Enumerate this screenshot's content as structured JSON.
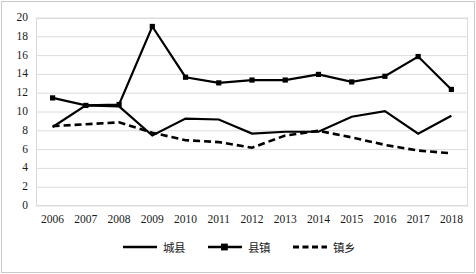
{
  "chart_data": {
    "type": "line",
    "title": "",
    "xlabel": "",
    "ylabel": "",
    "ylim": [
      0,
      20
    ],
    "ytick_step": 2,
    "grid": true,
    "legend_position": "bottom",
    "categories": [
      "2006",
      "2007",
      "2008",
      "2009",
      "2010",
      "2011",
      "2012",
      "2013",
      "2014",
      "2015",
      "2016",
      "2017",
      "2018"
    ],
    "yticks": [
      "0",
      "2",
      "4",
      "6",
      "8",
      "10",
      "12",
      "14",
      "16",
      "18",
      "20"
    ],
    "series": [
      {
        "name": "城县",
        "style": "solid",
        "marker": "none",
        "color": "#000000",
        "values": [
          8.4,
          10.7,
          10.6,
          7.5,
          9.3,
          9.2,
          7.7,
          7.9,
          7.9,
          9.5,
          10.1,
          7.7,
          9.6
        ]
      },
      {
        "name": "县镇",
        "style": "solid",
        "marker": "square",
        "color": "#000000",
        "values": [
          11.5,
          10.7,
          10.8,
          19.1,
          13.7,
          13.1,
          13.4,
          13.4,
          14.0,
          13.2,
          13.8,
          15.9,
          12.4
        ]
      },
      {
        "name": "镇乡",
        "style": "dashed",
        "marker": "none",
        "color": "#000000",
        "values": [
          8.5,
          8.7,
          8.9,
          7.8,
          7.0,
          6.8,
          6.2,
          7.5,
          8.0,
          7.3,
          6.5,
          5.9,
          5.6
        ]
      }
    ]
  }
}
